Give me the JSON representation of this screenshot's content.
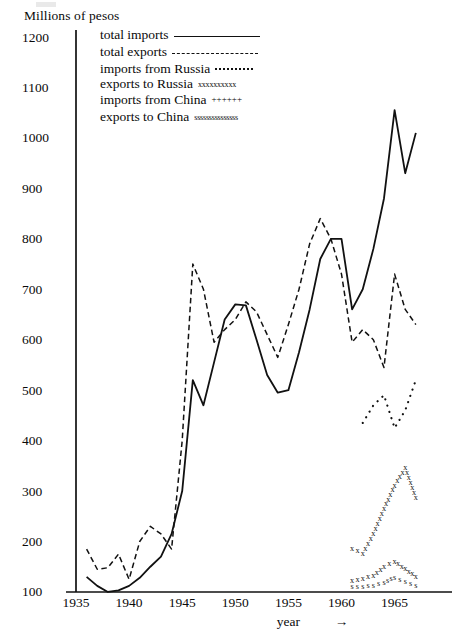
{
  "chart_data": {
    "type": "line",
    "title": "",
    "ylabel": "Millions of pesos",
    "xlabel": "year",
    "xlabel_arrow": "→",
    "ylim": [
      0,
      1200
    ],
    "xlim": [
      1935,
      1968
    ],
    "grid": false,
    "legend_position": "top-left-inside",
    "ytick_labels": [
      "1200",
      "1100",
      "1000",
      "900",
      "800",
      "700",
      "600",
      "500",
      "400",
      "300",
      "200",
      "100"
    ],
    "ytick_values": [
      1200,
      1100,
      1000,
      900,
      800,
      700,
      600,
      500,
      400,
      300,
      200,
      100
    ],
    "xtick_labels": [
      "1935",
      "1940",
      "1945",
      "1950",
      "1955",
      "1960",
      "1965"
    ],
    "xtick_values": [
      1935,
      1940,
      1945,
      1950,
      1955,
      1960,
      1965
    ],
    "series": [
      {
        "name": "total imports",
        "style": "solid",
        "x": [
          1936,
          1937,
          1938,
          1939,
          1940,
          1941,
          1942,
          1943,
          1944,
          1945,
          1946,
          1947,
          1948,
          1949,
          1950,
          1951,
          1952,
          1953,
          1954,
          1955,
          1956,
          1957,
          1958,
          1959,
          1960,
          1961,
          1962,
          1963,
          1964,
          1965,
          1966,
          1967
        ],
        "y": [
          130,
          112,
          100,
          103,
          112,
          128,
          150,
          170,
          215,
          300,
          520,
          470,
          555,
          640,
          670,
          668,
          600,
          530,
          495,
          500,
          575,
          660,
          760,
          800,
          800,
          660,
          700,
          780,
          880,
          1055,
          930,
          1010
        ]
      },
      {
        "name": "total exports",
        "style": "dashed",
        "x": [
          1936,
          1937,
          1938,
          1939,
          1940,
          1941,
          1942,
          1943,
          1944,
          1945,
          1946,
          1947,
          1948,
          1949,
          1950,
          1951,
          1952,
          1953,
          1954,
          1955,
          1956,
          1957,
          1958,
          1959,
          1960,
          1961,
          1962,
          1963,
          1964,
          1965,
          1966,
          1967
        ],
        "y": [
          185,
          145,
          148,
          175,
          125,
          200,
          230,
          215,
          185,
          400,
          750,
          700,
          595,
          620,
          640,
          675,
          655,
          610,
          565,
          630,
          700,
          790,
          840,
          800,
          730,
          595,
          620,
          600,
          545,
          730,
          660,
          630
        ]
      },
      {
        "name": "imports from Russia",
        "style": "dotted",
        "x": [
          1962,
          1963,
          1964,
          1965,
          1966,
          1967
        ],
        "y": [
          435,
          470,
          490,
          425,
          460,
          520
        ]
      },
      {
        "name": "exports to Russia",
        "style": "x-marks",
        "marker": "x",
        "x": [
          1961,
          1962,
          1963,
          1964,
          1965,
          1966,
          1967
        ],
        "y": [
          185,
          175,
          215,
          265,
          310,
          345,
          285
        ]
      },
      {
        "name": "imports from China",
        "style": "plus-marks",
        "marker": "+",
        "x": [
          1961,
          1962,
          1963,
          1964,
          1965,
          1966,
          1967
        ],
        "y": [
          122,
          125,
          132,
          150,
          160,
          145,
          130
        ]
      },
      {
        "name": "exports to China",
        "style": "s-marks",
        "marker": "s",
        "x": [
          1961,
          1962,
          1963,
          1964,
          1965,
          1966,
          1967
        ],
        "y": [
          110,
          110,
          112,
          118,
          128,
          120,
          112
        ]
      }
    ]
  },
  "legend": {
    "entries": [
      {
        "label": "total imports",
        "sample": "solid-line"
      },
      {
        "label": "total exports",
        "sample": "dashed-line"
      },
      {
        "label": "imports from Russia",
        "sample": "dotted-line"
      },
      {
        "label": "exports to Russia",
        "sample": "xxxxxxxxxx"
      },
      {
        "label": "imports from China",
        "sample": "++++++"
      },
      {
        "label": "exports to China",
        "sample": "sssssssssssssss"
      }
    ]
  }
}
